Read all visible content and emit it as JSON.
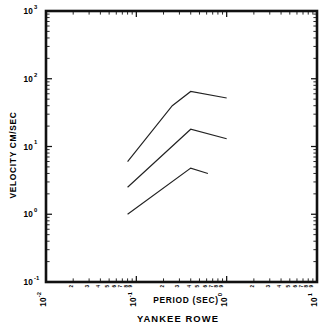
{
  "caption": "YANKEE ROWE",
  "chart_data": {
    "type": "line",
    "title": "YANKEE ROWE",
    "xlabel": "PERIOD (SEC)",
    "ylabel": "VELOCITY CM/SEC",
    "xscale": "log",
    "yscale": "log",
    "xlim": [
      0.01,
      10
    ],
    "ylim": [
      0.1,
      1000
    ],
    "grid": false,
    "legend": "none",
    "x_tick_labels": [
      "10-2",
      "10-1",
      "100",
      "101"
    ],
    "x_tick_values": [
      0.01,
      0.1,
      1,
      10
    ],
    "y_tick_labels": [
      "10-1",
      "100",
      "101",
      "102",
      "103"
    ],
    "y_tick_values": [
      0.1,
      1,
      10,
      100,
      1000
    ],
    "minor_tick_labels": [
      "2",
      "3",
      "4",
      "5",
      "6",
      "7",
      "8",
      "9"
    ],
    "series": [
      {
        "name": "upper-curve",
        "x": [
          0.08,
          0.25,
          0.4,
          1.0
        ],
        "y": [
          6.0,
          40.0,
          65.0,
          52.0
        ]
      },
      {
        "name": "middle-curve",
        "x": [
          0.08,
          0.4,
          1.0
        ],
        "y": [
          2.5,
          18.0,
          13.0
        ]
      },
      {
        "name": "lower-curve",
        "x": [
          0.08,
          0.4,
          0.62
        ],
        "y": [
          1.0,
          4.8,
          4.0
        ]
      }
    ]
  },
  "axes": {
    "x_title": "PERIOD (SEC)",
    "y_title": "VELOCITY CM/SEC",
    "x_labels": [
      {
        "base": "10",
        "exp": "-2"
      },
      {
        "base": "10",
        "exp": "-1"
      },
      {
        "base": "10",
        "exp": "0"
      },
      {
        "base": "10",
        "exp": "1"
      }
    ],
    "y_labels": [
      {
        "base": "10",
        "exp": "3"
      },
      {
        "base": "10",
        "exp": "2"
      },
      {
        "base": "10",
        "exp": "1"
      },
      {
        "base": "10",
        "exp": "0"
      },
      {
        "base": "10",
        "exp": "-1"
      }
    ]
  }
}
